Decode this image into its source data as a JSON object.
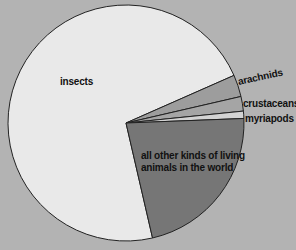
{
  "chart_data": {
    "type": "pie",
    "title": "",
    "categories": [
      "insects",
      "arachnids",
      "crustaceans",
      "myriapods",
      "all other kinds of living animals in the world"
    ],
    "values": [
      72,
      3,
      2,
      1,
      22
    ],
    "colors": [
      "#e9e9e9",
      "#9d9d9d",
      "#a5a5a5",
      "#d3d3d3",
      "#767676"
    ],
    "start_angle_deg": 77,
    "direction": "clockwise",
    "legend": "none (labels placed on/next to slices)",
    "labels": {
      "insects": "insects",
      "arachnids": "arachnids",
      "crustaceans": "crustaceans",
      "myriapods": "myriapods",
      "other_line1": "all other kinds of living",
      "other_line2": "animals in the world"
    }
  },
  "colors": {
    "background": "#b3b3b3",
    "outline": "#222222",
    "text": "#111111"
  }
}
